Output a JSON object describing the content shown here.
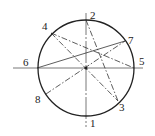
{
  "diagram": {
    "center": {
      "x": 86,
      "y": 68
    },
    "radius": 48,
    "stroke_color": "#222222",
    "axes": {
      "horizontal": {
        "x1": 13,
        "y1": 68,
        "x2": 143,
        "y2": 68
      },
      "vertical": {
        "x1": 86,
        "y1": 13,
        "x2": 86,
        "y2": 127
      }
    },
    "points": [
      {
        "id": "1",
        "label": "1",
        "x": 86,
        "y": 116,
        "lx": 90,
        "ly": 127
      },
      {
        "id": "2",
        "label": "2",
        "x": 86,
        "y": 20,
        "lx": 90,
        "ly": 19
      },
      {
        "id": "3",
        "label": "3",
        "x": 118,
        "y": 101,
        "lx": 119,
        "ly": 111
      },
      {
        "id": "4",
        "label": "4",
        "x": 51,
        "y": 33,
        "lx": 42,
        "ly": 30
      },
      {
        "id": "5",
        "label": "5",
        "x": 134,
        "y": 68,
        "lx": 139,
        "ly": 65
      },
      {
        "id": "6",
        "label": "6",
        "x": 37,
        "y": 68,
        "lx": 23,
        "ly": 66
      },
      {
        "id": "7",
        "label": "7",
        "x": 125,
        "y": 41,
        "lx": 128,
        "ly": 44
      },
      {
        "id": "8",
        "label": "8",
        "x": 46,
        "y": 94,
        "lx": 35,
        "ly": 103
      }
    ],
    "chords": [
      {
        "from": "4",
        "to": "5",
        "style": "dash-dot"
      },
      {
        "from": "4",
        "to": "3",
        "style": "dash-dot"
      },
      {
        "from": "2",
        "to": "3",
        "style": "dash-dot"
      },
      {
        "from": "6",
        "to": "7",
        "style": "solid"
      },
      {
        "from": "8",
        "to": "7",
        "style": "dash-dot"
      }
    ]
  }
}
